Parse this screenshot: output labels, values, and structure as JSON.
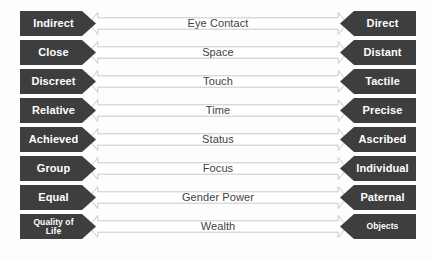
{
  "diagram": {
    "type": "bipolar-continuum-scales",
    "colors": {
      "pole_fill": "#3e3e3e",
      "pole_text": "#ffffff",
      "arrow_fill": "#ffffff",
      "arrow_stroke": "#c9c9c9",
      "center_text": "#3f3f3f",
      "background": "#fdfdfd"
    },
    "rows": [
      {
        "left": "Indirect",
        "center": "Eye Contact",
        "right": "Direct",
        "left_small": false,
        "right_small": false
      },
      {
        "left": "Close",
        "center": "Space",
        "right": "Distant",
        "left_small": false,
        "right_small": false
      },
      {
        "left": "Discreet",
        "center": "Touch",
        "right": "Tactile",
        "left_small": false,
        "right_small": false
      },
      {
        "left": "Relative",
        "center": "Time",
        "right": "Precise",
        "left_small": false,
        "right_small": false
      },
      {
        "left": "Achieved",
        "center": "Status",
        "right": "Ascribed",
        "left_small": false,
        "right_small": false
      },
      {
        "left": "Group",
        "center": "Focus",
        "right": "Individual",
        "left_small": false,
        "right_small": false
      },
      {
        "left": "Equal",
        "center": "Gender Power",
        "right": "Paternal",
        "left_small": false,
        "right_small": false
      },
      {
        "left": "Quality of\nLife",
        "center": "Wealth",
        "right": "Objects",
        "left_small": true,
        "right_small": true
      }
    ]
  }
}
